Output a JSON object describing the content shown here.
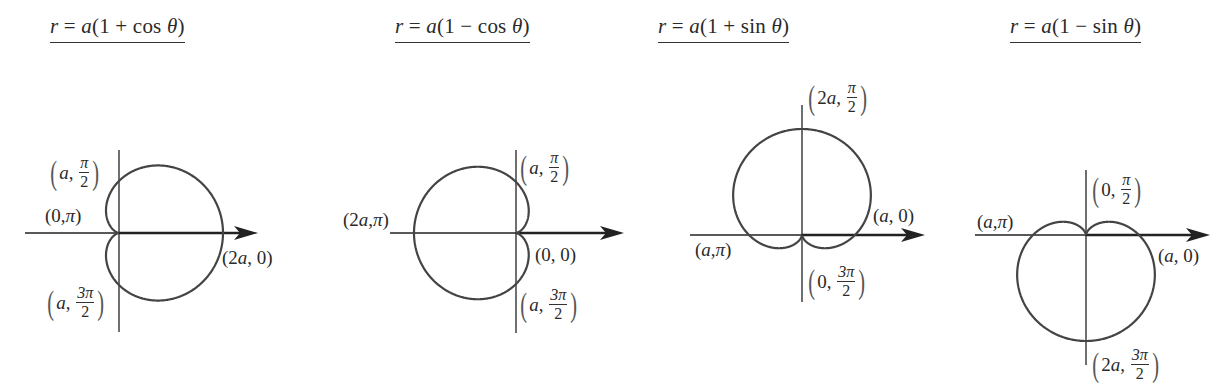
{
  "figures": [
    {
      "id": "cos-plus",
      "equation": {
        "r": "r",
        "eq": " = ",
        "a": "a",
        "rest": "(1 + cos ",
        "theta": "θ",
        "close": ")"
      },
      "title_pos": [
        50,
        14
      ],
      "origin": [
        119,
        233
      ],
      "a": 52,
      "type": "cos",
      "sign": 1,
      "h_axis": [
        25,
        258
      ],
      "v_axis": [
        150,
        332
      ],
      "labels": [
        {
          "name": "label-a-pi-over-2",
          "kind": "frac",
          "pre": "a,",
          "num": "π",
          "den": "2",
          "pos": [
            48,
            155
          ]
        },
        {
          "name": "label-0-pi",
          "kind": "plain",
          "text": "(0, π)",
          "pos": [
            45,
            206
          ]
        },
        {
          "name": "label-2a-0",
          "kind": "plain",
          "text": "(2a, 0)",
          "pos": [
            222,
            248
          ]
        },
        {
          "name": "label-a-3pi-over-2",
          "kind": "frac",
          "pre": "a,",
          "num": "3π",
          "den": "2",
          "pos": [
            45,
            285
          ]
        }
      ]
    },
    {
      "id": "cos-minus",
      "equation": {
        "r": "r",
        "eq": " = ",
        "a": "a",
        "rest": "(1 − cos ",
        "theta": "θ",
        "close": ")"
      },
      "title_pos": [
        395,
        14
      ],
      "origin": [
        516,
        233
      ],
      "a": 51,
      "type": "cos",
      "sign": -1,
      "h_axis": [
        390,
        624
      ],
      "v_axis": [
        150,
        333
      ],
      "labels": [
        {
          "name": "label-a-pi-over-2",
          "kind": "frac",
          "pre": "a,",
          "num": "π",
          "den": "2",
          "pos": [
            518,
            150
          ]
        },
        {
          "name": "label-2a-pi",
          "kind": "plain",
          "text": "(2a, π)",
          "pos": [
            343,
            210
          ]
        },
        {
          "name": "label-0-0",
          "kind": "plain",
          "text": "(0, 0)",
          "pos": [
            535,
            245
          ]
        },
        {
          "name": "label-a-3pi-over-2",
          "kind": "frac",
          "pre": "a,",
          "num": "3π",
          "den": "2",
          "pos": [
            518,
            287
          ]
        }
      ]
    },
    {
      "id": "sin-plus",
      "equation": {
        "r": "r",
        "eq": " = ",
        "a": "a",
        "rest": "(1 + sin ",
        "theta": "θ",
        "close": ")"
      },
      "title_pos": [
        658,
        14
      ],
      "origin": [
        802,
        235
      ],
      "a": 53,
      "type": "sin",
      "sign": 1,
      "h_axis": [
        690,
        925
      ],
      "v_axis": [
        105,
        302
      ],
      "labels": [
        {
          "name": "label-2a-pi-over-2",
          "kind": "frac",
          "pre": "2a,",
          "num": "π",
          "den": "2",
          "pos": [
            806,
            80
          ]
        },
        {
          "name": "label-a-0",
          "kind": "plain",
          "text": "(a, 0)",
          "pos": [
            873,
            206
          ]
        },
        {
          "name": "label-a-pi",
          "kind": "plain",
          "text": "(a, π)",
          "pos": [
            695,
            240
          ]
        },
        {
          "name": "label-0-3pi-over-2",
          "kind": "frac",
          "pre": "0,",
          "num": "3π",
          "den": "2",
          "pos": [
            806,
            264
          ]
        }
      ]
    },
    {
      "id": "sin-minus",
      "equation": {
        "r": "r",
        "eq": " = ",
        "a": "a",
        "rest": "(1 − sin ",
        "theta": "θ",
        "close": ")"
      },
      "title_pos": [
        1010,
        14
      ],
      "origin": [
        1086,
        235
      ],
      "a": 53,
      "type": "sin",
      "sign": -1,
      "h_axis": [
        975,
        1210
      ],
      "v_axis": [
        170,
        365
      ],
      "labels": [
        {
          "name": "label-0-pi-over-2",
          "kind": "frac",
          "pre": "0,",
          "num": "π",
          "den": "2",
          "pos": [
            1090,
            172
          ]
        },
        {
          "name": "label-a-pi",
          "kind": "plain",
          "text": "(a, π)",
          "pos": [
            977,
            212
          ]
        },
        {
          "name": "label-a-0",
          "kind": "plain",
          "text": "(a, 0)",
          "pos": [
            1158,
            246
          ]
        },
        {
          "name": "label-2a-3pi-over-2",
          "kind": "frac",
          "pre": "2a,",
          "num": "3π",
          "den": "2",
          "pos": [
            1090,
            347
          ]
        }
      ]
    }
  ],
  "colors": {
    "curve": "#444444",
    "axis": "#222222",
    "text": "#2a2a2a"
  }
}
